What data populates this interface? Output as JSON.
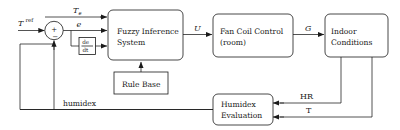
{
  "diagram": {
    "type": "block-diagram",
    "background_color": "#ffffff",
    "line_color": "#1a1a1a",
    "blocks": [
      {
        "id": "fis",
        "label_line1": "Fuzzy Inference",
        "label_line2": "System"
      },
      {
        "id": "fancoil",
        "label_line1": "Fan Coil Control",
        "label_line2": "(room)"
      },
      {
        "id": "indoor",
        "label_line1": "Indoor",
        "label_line2": "Conditions"
      },
      {
        "id": "rulebase",
        "label_line1": "Rule Base",
        "label_line2": ""
      },
      {
        "id": "humidex",
        "label_line1": "Humidex",
        "label_line2": "Evaluation"
      }
    ],
    "derivative_block": {
      "numerator": "de",
      "denominator": "dt"
    },
    "summing_junction": {
      "plus": "+",
      "minus": "−"
    },
    "signals": {
      "reference": "T",
      "reference_superscript": "ref",
      "outdoor_temp": "T",
      "outdoor_temp_subscript": "e",
      "error": "e",
      "control": "U",
      "plant_output": "G",
      "relative_humidity": "HR",
      "temperature": "T",
      "feedback": "humidex"
    }
  }
}
